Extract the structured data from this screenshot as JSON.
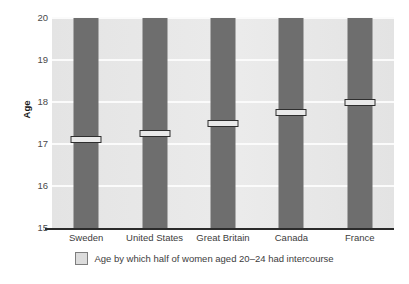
{
  "chart_data": {
    "type": "bar",
    "title": "",
    "subtitle": "",
    "xlabel": "",
    "ylabel": "Age",
    "ylim": [
      15,
      20
    ],
    "yticks": [
      20,
      19,
      18,
      17,
      16,
      15
    ],
    "grid": true,
    "legend_position": "bottom",
    "categories": [
      "Sweden",
      "United States",
      "Great Britain",
      "Canada",
      "France"
    ],
    "series": [
      {
        "name": "Age by which half of women aged 20–24 had intercourse",
        "values": [
          17.1,
          17.25,
          17.5,
          17.75,
          18.0
        ]
      }
    ],
    "bar_extent_top": 20,
    "colors": {
      "bar": "#6e6e6e",
      "marker_fill": "#e9e9e9",
      "marker_border": "#2e2e2e",
      "plot_background": "#e6e6e6",
      "gridline": "#fbfbfb",
      "axis": "#2b2b2b",
      "text": "#3d3d3d",
      "legend_swatch": "#dcdcdc"
    }
  },
  "axis": {
    "y_title": "Age",
    "y_tick_labels": [
      "20",
      "19",
      "18",
      "17",
      "16",
      "15"
    ]
  },
  "legend": {
    "items": [
      {
        "label": "Age by which half of women aged 20–24 had intercourse"
      }
    ]
  }
}
